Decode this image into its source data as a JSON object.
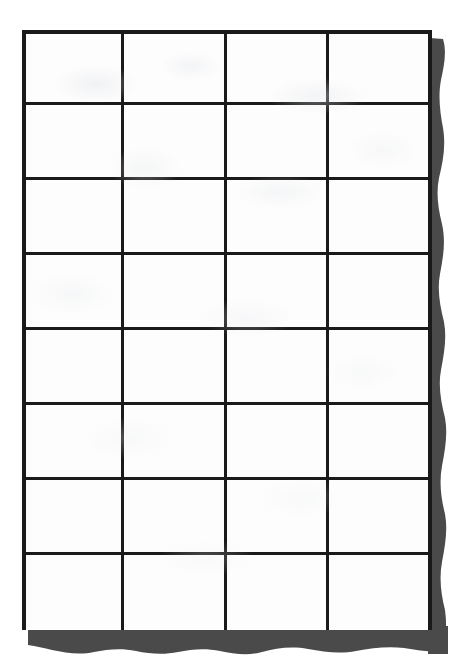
{
  "document": {
    "kind": "scanned-paper-sheet",
    "title": "Blank Grid Table",
    "content_text": "",
    "page_background_color": "#ffffff",
    "sheet_color": "#fdfdfd"
  },
  "table": {
    "name": "blank-grid-table",
    "columns": 4,
    "rows": 8,
    "has_header_row": false,
    "column_headers": [
      "",
      "",
      "",
      ""
    ],
    "cell_values": [
      [
        "",
        "",
        "",
        ""
      ],
      [
        "",
        "",
        "",
        ""
      ],
      [
        "",
        "",
        "",
        ""
      ],
      [
        "",
        "",
        "",
        ""
      ],
      [
        "",
        "",
        "",
        ""
      ],
      [
        "",
        "",
        "",
        ""
      ],
      [
        "",
        "",
        "",
        ""
      ],
      [
        "",
        "",
        "",
        ""
      ]
    ],
    "geometry": {
      "left": 22,
      "top": 30,
      "width": 410,
      "height": 600,
      "column_x": [
        22,
        124,
        227,
        329,
        432
      ],
      "row_y": [
        30,
        105,
        180,
        255,
        330,
        405,
        480,
        555,
        630
      ],
      "line_width_px": 3,
      "outer_line_width_px": 4
    },
    "line_color": "#1a1a1a",
    "cell_fill_color": "#fdfdfd"
  },
  "shadow": {
    "name": "paper-drop-shadow",
    "color": "#4a4a4a",
    "edges": [
      "right",
      "bottom"
    ],
    "right_strip": {
      "x_start": 432,
      "x_end": 449,
      "y_start": 38,
      "y_end": 648
    },
    "bottom_strip": {
      "y_start": 629,
      "y_end": 651,
      "x_start": 28,
      "x_end": 449
    },
    "contour": "wavy"
  }
}
